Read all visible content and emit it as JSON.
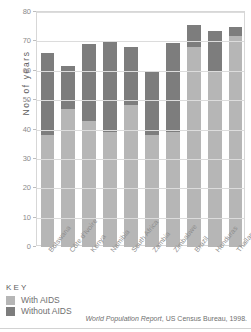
{
  "chart_data": {
    "type": "bar",
    "subtype": "stacked-bar",
    "title": "",
    "xlabel": "",
    "ylabel": "No. of years",
    "ylim": [
      0,
      80
    ],
    "ytick_step": 10,
    "yticks": [
      80,
      70,
      60,
      50,
      40,
      30,
      20,
      10,
      0
    ],
    "grid": true,
    "legend_position": "below-left",
    "categories": [
      "Botswana",
      "Côte d'Ivoire",
      "Kenya",
      "Namibia",
      "South Africa",
      "Zambia",
      "Zimbabwe",
      "Brazil",
      "Honduras",
      "Thailand"
    ],
    "series": [
      {
        "name": "With AIDS",
        "color": "#b6b6b6",
        "values": [
          38,
          47,
          43,
          39,
          48.5,
          38,
          39,
          68,
          60,
          72
        ]
      },
      {
        "name": "Without AIDS",
        "color": "#7d7d7d",
        "values": [
          66,
          61.5,
          69,
          70,
          68,
          60,
          69.5,
          75.5,
          73.5,
          75
        ]
      }
    ],
    "note": "Each bar is a stacked column: the light grey lower segment is life expectancy With AIDS, the dark grey upper segment extends to the life expectancy Without AIDS total."
  },
  "axis": {
    "y_title": "No. of years"
  },
  "key": {
    "heading": "KEY",
    "entries": [
      {
        "label": "With AIDS",
        "color": "#b6b6b6"
      },
      {
        "label": "Without AIDS",
        "color": "#7d7d7d"
      }
    ]
  },
  "source": {
    "publication": "World Population Report",
    "rest": ", US Census Bureau, 1998."
  }
}
